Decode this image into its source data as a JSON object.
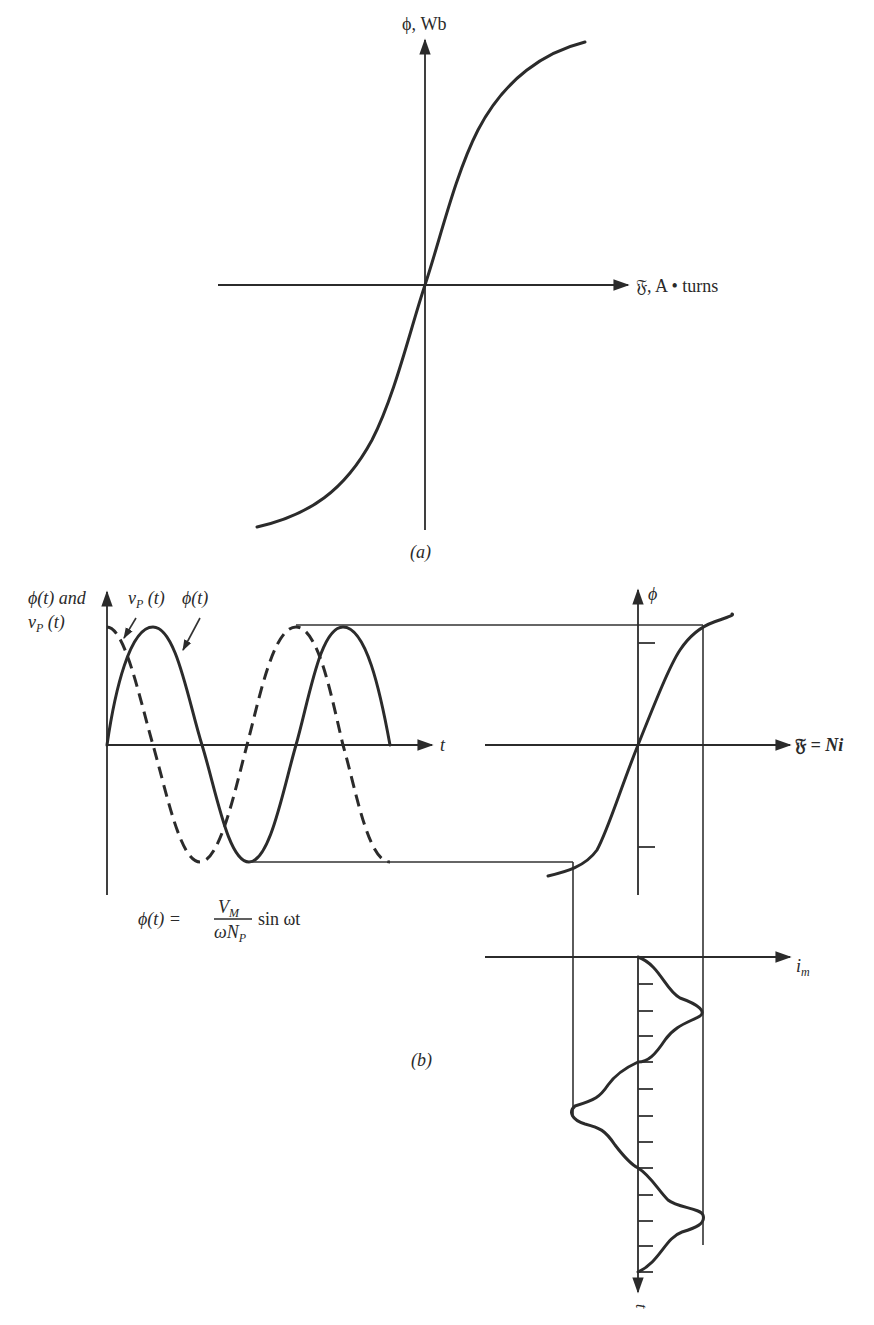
{
  "figure": {
    "part_a": {
      "caption": "(a)",
      "y_axis_label": "ϕ, Wb",
      "x_axis_label_symbol": "𝔉",
      "x_axis_label_text": ", A • turns",
      "curve": "magnetization (saturation) curve: flux vs magnetomotive force"
    },
    "part_b": {
      "caption": "(b)",
      "left_plot": {
        "y_axis_label_line1": "ϕ(t) and",
        "y_axis_label_line2": "v",
        "y_axis_label_line2_sub": "P",
        "y_axis_label_line2_tail": " (t)",
        "x_axis_label": "t",
        "pointer_vp_label": "v",
        "pointer_vp_sub": "P",
        "pointer_vp_tail": " (t)",
        "pointer_phi_label": "ϕ(t)",
        "equation_lhs": "ϕ(t) =",
        "equation_num": "V",
        "equation_num_sub": "M",
        "equation_den": "ωN",
        "equation_den_sub": "P",
        "equation_rhs": "sin ωt",
        "series": [
          {
            "name": "ϕ(t)",
            "style": "solid",
            "shape": "sine"
          },
          {
            "name": "v_P(t)",
            "style": "dashed",
            "shape": "cosine"
          }
        ]
      },
      "right_plot": {
        "y_axis_label": "ϕ",
        "x_axis_label_symbol": "𝔉",
        "x_axis_label_text": " = Ni",
        "current_axis_label": "i",
        "current_axis_sub": "m",
        "time_axis_label": "t"
      }
    }
  },
  "colors": {
    "ink": "#2b2b2b",
    "background": "#ffffff"
  }
}
